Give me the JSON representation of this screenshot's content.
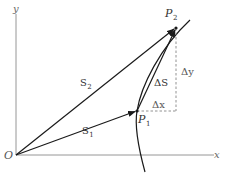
{
  "diagram": {
    "title": "",
    "colors": {
      "background": "#ffffff",
      "axis": "#8a8a8a",
      "vector": "#1a1a1a",
      "curve": "#1a1a1a",
      "dashed": "#777777",
      "text": "#333333"
    },
    "axes": {
      "x_label": "x",
      "y_label": "y",
      "origin_label": "O"
    },
    "points": {
      "p1": {
        "label": "P",
        "sub": "1"
      },
      "p2": {
        "label": "P",
        "sub": "2"
      }
    },
    "vectors": {
      "s1": {
        "label": "S",
        "sub": "1"
      },
      "s2": {
        "label": "S",
        "sub": "2"
      },
      "delta_s": {
        "label": "ΔS"
      }
    },
    "increments": {
      "delta_x": "Δx",
      "delta_y": "Δy"
    }
  }
}
